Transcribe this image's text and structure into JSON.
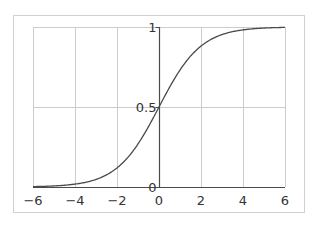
{
  "chart_data": {
    "type": "line",
    "title": "",
    "xlabel": "",
    "ylabel": "",
    "xlim": [
      -6,
      6
    ],
    "ylim": [
      0,
      1
    ],
    "grid": true,
    "function": "sigmoid(x) = 1 / (1 + e^(-x))",
    "x_ticks": [
      -6,
      -4,
      -2,
      0,
      2,
      4,
      6
    ],
    "x_tick_labels": [
      "−6",
      "−4",
      "−2",
      "0",
      "2",
      "4",
      "6"
    ],
    "y_ticks": [
      0,
      0.5,
      1
    ],
    "y_tick_labels": [
      "0",
      "0.5",
      "1"
    ],
    "series": [
      {
        "name": "sigmoid",
        "x": [
          -6,
          -5,
          -4,
          -3,
          -2,
          -1,
          0,
          1,
          2,
          3,
          4,
          5,
          6
        ],
        "y": [
          0.0025,
          0.0067,
          0.018,
          0.047,
          0.119,
          0.269,
          0.5,
          0.731,
          0.881,
          0.953,
          0.982,
          0.9933,
          0.9975
        ]
      }
    ],
    "colors": {
      "curve": "#4a4a4a",
      "axis": "#4a4a4a",
      "grid": "#cccccc",
      "frame": "#d0d0d0"
    }
  }
}
